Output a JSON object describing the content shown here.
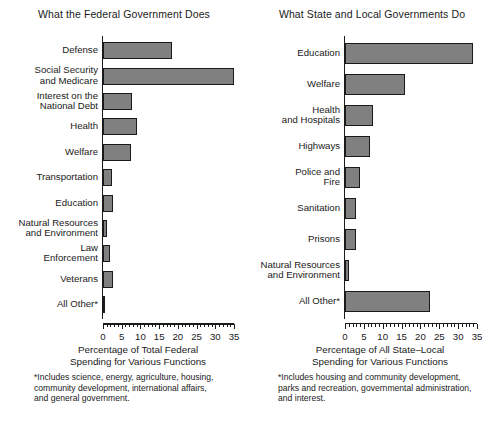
{
  "chart_data": [
    {
      "type": "bar",
      "orientation": "horizontal",
      "title": "What the Federal Government Does",
      "categories": [
        "Defense",
        "Social Security\nand Medicare",
        "Interest on the\nNational Debt",
        "Health",
        "Welfare",
        "Transportation",
        "Education",
        "Natural Resources\nand Environment",
        "Law\nEnforcement",
        "Veterans",
        "All Other*"
      ],
      "values": [
        18.4,
        35.0,
        7.8,
        9.0,
        7.5,
        2.5,
        2.8,
        1.0,
        1.8,
        2.8,
        0.5
      ],
      "xlabel": "Percentage of Total Federal\nSpending for Various Functions",
      "ylabel": "",
      "xlim": [
        0,
        35
      ],
      "xticks": [
        0,
        5,
        10,
        15,
        20,
        25,
        30,
        35
      ],
      "xtick_labels": [
        "0",
        "5",
        "10",
        "15",
        "20",
        "25",
        "30",
        "35"
      ],
      "minor_tick_step": 1,
      "grid": false,
      "legend": false,
      "bar_color": "#808080",
      "bar_edge_color": "#1a1a1a",
      "footnote": "*Includes science, energy, agriculture, housing,\ncommunity development, international affairs,\nand general government."
    },
    {
      "type": "bar",
      "orientation": "horizontal",
      "title": "What State and Local Governments Do",
      "categories": [
        "Education",
        "Welfare",
        "Health\nand Hospitals",
        "Highways",
        "Police and\nFire",
        "Sanitation",
        "Prisons",
        "Natural Resources\nand Environment",
        "All Other*"
      ],
      "values": [
        34.0,
        16.0,
        7.5,
        6.5,
        4.0,
        3.0,
        3.0,
        1.0,
        22.5
      ],
      "xlabel": "Percentage of All State–Local\nSpending for Various Functions",
      "ylabel": "",
      "xlim": [
        0,
        35
      ],
      "xticks": [
        0,
        5,
        10,
        15,
        20,
        25,
        30,
        35
      ],
      "xtick_labels": [
        "0",
        "5",
        "10",
        "15",
        "20",
        "25",
        "30",
        "35"
      ],
      "minor_tick_step": 1,
      "grid": false,
      "legend": false,
      "bar_color": "#808080",
      "bar_edge_color": "#1a1a1a",
      "footnote": "*Includes housing and community development,\nparks and recreation, governmental administration,\nand  interest."
    }
  ]
}
